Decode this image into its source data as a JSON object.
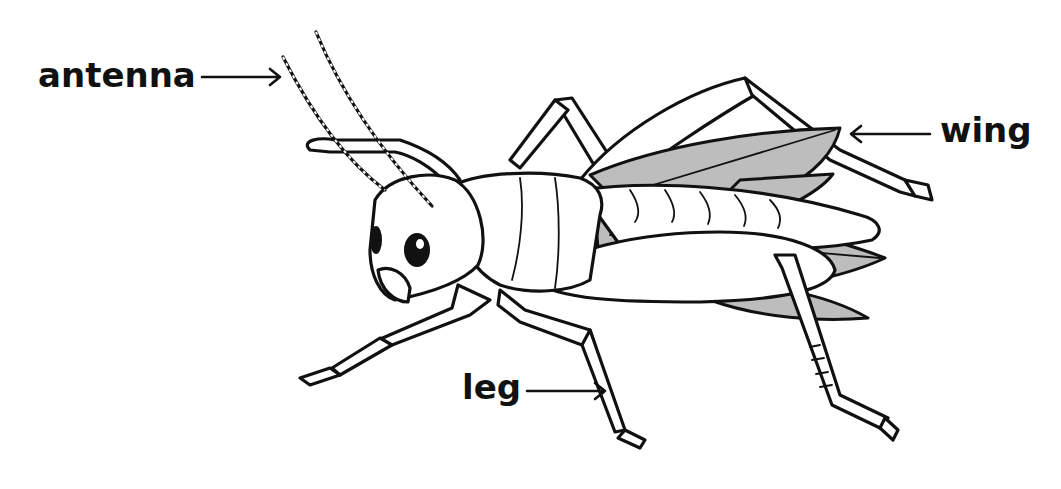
{
  "diagram": {
    "labels": [
      {
        "id": "antenna",
        "text": "antenna"
      },
      {
        "id": "wing",
        "text": "wing"
      },
      {
        "id": "leg",
        "text": "leg"
      }
    ],
    "colors": {
      "outline": "#111111",
      "wing_fill": "#bdbdbd",
      "body_fill": "#ffffff",
      "background": "#ffffff"
    }
  }
}
